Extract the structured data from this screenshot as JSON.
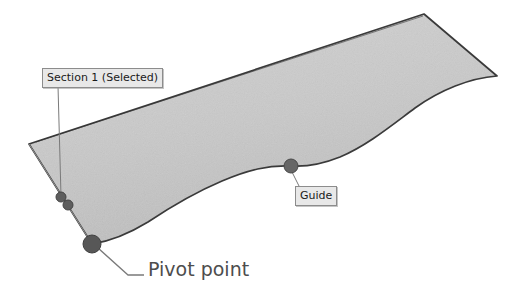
{
  "diagram": {
    "background_color": "#ffffff",
    "surface": {
      "name": "Section 1",
      "state": "Selected",
      "fill_color": "#c9c9c9",
      "edge_color": "#3a3a3a",
      "fill_opacity": 1
    },
    "callouts": [
      {
        "id": "section",
        "text": "Section 1 (Selected)",
        "style": "boxed",
        "box_fill": "#e8e8e8",
        "box_border": "#8c8c8c",
        "text_color": "#1a1a1a",
        "x": 42,
        "y": 68,
        "leader_to_x": 62,
        "leader_to_y": 198
      },
      {
        "id": "guide",
        "text": "Guide",
        "style": "boxed",
        "box_fill": "#e8e8e8",
        "box_border": "#8c8c8c",
        "text_color": "#1a1a1a",
        "x": 295,
        "y": 186,
        "leader_to_x": 291,
        "leader_to_y": 170
      },
      {
        "id": "pivot",
        "text": "Pivot point",
        "style": "plain",
        "text_color": "#4d4d4d",
        "x": 148,
        "y": 258,
        "leader_to_x": 98,
        "leader_to_y": 248
      }
    ],
    "nodes": [
      {
        "id": "section-handle-upper",
        "label": "Section 1",
        "x": 61,
        "y": 197,
        "radius": 5,
        "color": "#5e5e5e"
      },
      {
        "id": "section-handle-lower",
        "label": "Section 1",
        "x": 68,
        "y": 205,
        "radius": 5,
        "color": "#5e5e5e"
      },
      {
        "id": "pivot-point",
        "label": "Pivot point",
        "x": 92,
        "y": 244,
        "radius": 9,
        "color": "#575757"
      },
      {
        "id": "guide-point",
        "label": "Guide",
        "x": 291,
        "y": 166,
        "radius": 7,
        "color": "#666666"
      }
    ],
    "leader_line_color": "#7a7a7a"
  }
}
